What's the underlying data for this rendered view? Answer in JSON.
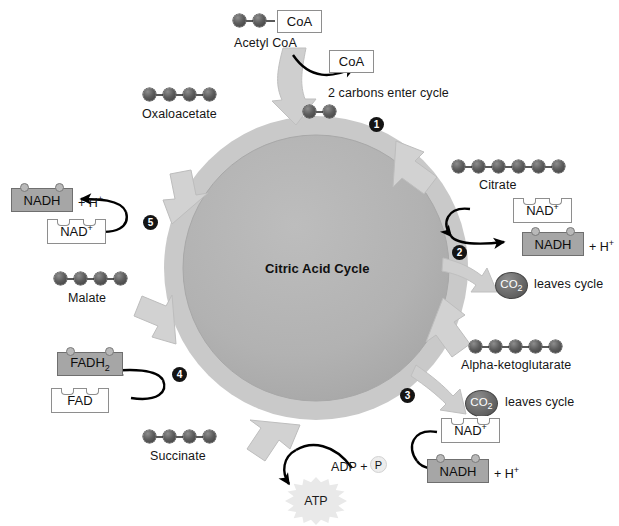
{
  "diagram": {
    "title": "Citric Acid Cycle",
    "colors": {
      "ring_outer": "#c9c9c9",
      "ring_inner": "#b3b3b3",
      "bead": "#5d5d5d",
      "nadh_box": "#a6a6a6",
      "co2_disc": "#6d6d6d",
      "atp_burst": "#e9e9e9",
      "step_badge": "#141414",
      "arrow_black": "#000000"
    }
  },
  "inputs": {
    "acetyl_coa_box": "CoA",
    "acetyl_coa_label": "Acetyl CoA",
    "acetyl_coa_carbons": 2,
    "coa_released_box": "CoA",
    "two_carbons_note": "2 carbons enter cycle",
    "entering_carbons": 2
  },
  "steps": [
    {
      "number": "1",
      "label": "1"
    },
    {
      "number": "2",
      "label": "2"
    },
    {
      "number": "3",
      "label": "3"
    },
    {
      "number": "4",
      "label": "4"
    },
    {
      "number": "5",
      "label": "5"
    }
  ],
  "molecules": [
    {
      "name": "Oxaloacetate",
      "carbons": 4
    },
    {
      "name": "Citrate",
      "carbons": 6
    },
    {
      "name": "Alpha-ketoglutarate",
      "carbons": 5
    },
    {
      "name": "Succinate",
      "carbons": 4
    },
    {
      "name": "Malate",
      "carbons": 4
    }
  ],
  "cofactors": {
    "nad_plus": "NAD",
    "nad_plus_charge": "+",
    "nadh": "NADH",
    "plus_h": "+ H",
    "plus_h_charge": "+",
    "fad": "FAD",
    "fadh2": "FADH",
    "fadh2_sub": "2"
  },
  "products": {
    "co2": "CO",
    "co2_sub": "2",
    "leaves_cycle": "leaves cycle",
    "adp": "ADP +",
    "phosphate": "P",
    "atp": "ATP"
  }
}
